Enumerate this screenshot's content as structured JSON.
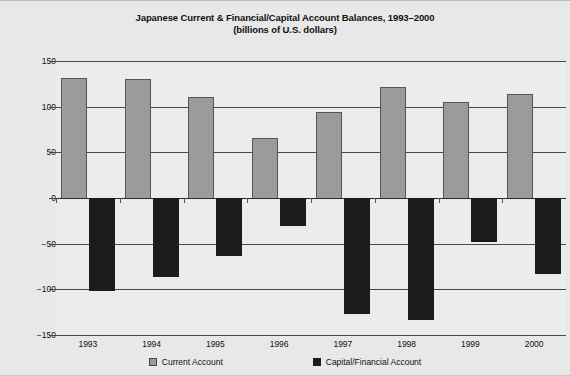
{
  "chart_data": {
    "type": "bar",
    "title": "Japanese Current & Financial/Capital Account Balances, 1993–2000",
    "subtitle": "(billions of U.S. dollars)",
    "xlabel": "",
    "ylabel": "",
    "categories": [
      "1993",
      "1994",
      "1995",
      "1996",
      "1997",
      "1998",
      "1999",
      "2000"
    ],
    "series": [
      {
        "name": "Current Account",
        "color": "#9b9b9b",
        "values": [
          131,
          130,
          111,
          66,
          94,
          121,
          105,
          114
        ]
      },
      {
        "name": "Capital/Financial Account",
        "color": "#1c1c1c",
        "values": [
          -102,
          -86,
          -64,
          -31,
          -127,
          -134,
          -48,
          -83
        ]
      }
    ],
    "ylim": [
      -150,
      150
    ],
    "yticks": [
      150,
      100,
      50,
      0,
      -50,
      -100,
      -150
    ],
    "ytick_labels": [
      "150",
      "100",
      "50",
      "0",
      "−50",
      "−100",
      "−150"
    ],
    "grid": true,
    "legend_position": "bottom"
  },
  "legend": {
    "entries": [
      {
        "label": "Current Account"
      },
      {
        "label": "Capital/Financial Account"
      }
    ]
  }
}
